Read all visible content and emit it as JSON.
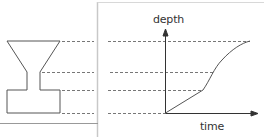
{
  "diagram": {
    "type": "container-filling-graph",
    "container_shape": "funnel-on-rectangular-base",
    "graph": {
      "y_axis_label": "depth",
      "x_axis_label": "time",
      "segments": [
        {
          "shape": "rectangular base",
          "rate": "linear"
        },
        {
          "shape": "narrow neck",
          "rate": "steep"
        },
        {
          "shape": "widening funnel",
          "rate": "decreasing"
        }
      ]
    },
    "guide_levels": 4,
    "colors": {
      "stroke": "#555555",
      "dashed": "#777777",
      "panel_border": "#c8c8c8"
    }
  }
}
